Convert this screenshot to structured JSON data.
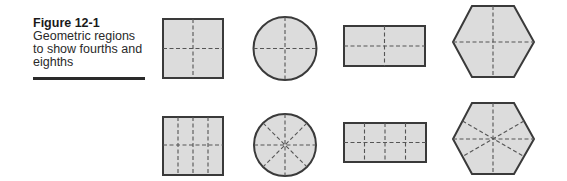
{
  "figure": {
    "label": "Figure 12-1",
    "caption_lines": [
      "Geometric regions",
      "to show fourths and",
      "eighths"
    ]
  },
  "colors": {
    "fill": "#dcdcdc",
    "outline": "#3a3a3a",
    "dash": "#555555",
    "text": "#2a2a2a"
  },
  "rows": [
    {
      "name": "fourths",
      "parts": 4,
      "shapes": [
        "square",
        "circle",
        "rectangle",
        "hexagon"
      ]
    },
    {
      "name": "eighths",
      "parts": 8,
      "shapes": [
        "square",
        "circle",
        "rectangle",
        "hexagon"
      ]
    }
  ]
}
